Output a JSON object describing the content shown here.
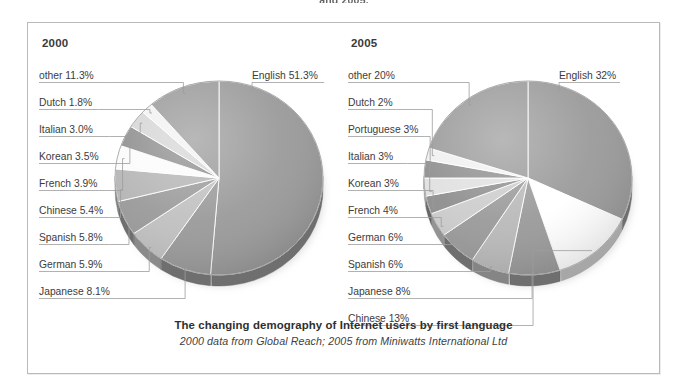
{
  "top_clipped_heading": "and 2005.",
  "frame": {
    "border_color": "#b9b9b9"
  },
  "caption": {
    "title": "The changing demography of Internet users by first language",
    "subtitle": "2000 data from Global Reach; 2005 from Miniwatts International Ltd"
  },
  "panels": [
    {
      "year": "2000"
    },
    {
      "year": "2005"
    }
  ],
  "chart_data": [
    {
      "type": "pie",
      "title": "2000",
      "start_angle_deg": 0,
      "direction": "clockwise",
      "units": "percent",
      "labels": [
        "English 51.3%",
        "Japanese 8.1%",
        "German 5.9%",
        "Spanish 5.8%",
        "Chinese 5.4%",
        "French 3.9%",
        "Korean 3.5%",
        "Italian 3.0%",
        "Dutch 1.8%",
        "other 11.3%"
      ],
      "categories": [
        "English",
        "Japanese",
        "German",
        "Spanish",
        "Chinese",
        "French",
        "Korean",
        "Italian",
        "Dutch",
        "other"
      ],
      "values": [
        51.3,
        8.1,
        5.9,
        5.8,
        5.4,
        3.9,
        3.5,
        3.0,
        1.8,
        11.3
      ],
      "colors": [
        "#9a9a9a",
        "#9a9a9a",
        "#c0c0c0",
        "#9a9a9a",
        "#b5b5b5",
        "#fbfbfb",
        "#8e8e8e",
        "#d6d6d6",
        "#f2f2f2",
        "#9a9a9a"
      ]
    },
    {
      "type": "pie",
      "title": "2005",
      "start_angle_deg": 0,
      "direction": "clockwise",
      "units": "percent",
      "labels": [
        "English 32%",
        "Chinese 13%",
        "Japanese 8%",
        "Spanish 6%",
        "German 6%",
        "French 4%",
        "Korean 3%",
        "Italian 3%",
        "Portuguese 3%",
        "Dutch 2%",
        "other 20%"
      ],
      "categories": [
        "English",
        "Chinese",
        "Japanese",
        "Spanish",
        "German",
        "French",
        "Korean",
        "Italian",
        "Portuguese",
        "Dutch",
        "other"
      ],
      "values": [
        32,
        13,
        8,
        6,
        6,
        4,
        3,
        3,
        3,
        2,
        20
      ],
      "colors": [
        "#9a9a9a",
        "#ffffff",
        "#9a9a9a",
        "#b9b9b9",
        "#9a9a9a",
        "#cccccc",
        "#8e8e8e",
        "#e0e0e0",
        "#8e8e8e",
        "#f0f0f0",
        "#9a9a9a"
      ]
    }
  ],
  "left_labels": [
    {
      "text": "other 11.3%",
      "x": 11,
      "y": 47
    },
    {
      "text": "Dutch 1.8%",
      "x": 11,
      "y": 74
    },
    {
      "text": "Italian 3.0%",
      "x": 11,
      "y": 101
    },
    {
      "text": "Korean 3.5%",
      "x": 11,
      "y": 128
    },
    {
      "text": "French 3.9%",
      "x": 11,
      "y": 155
    },
    {
      "text": "Chinese 5.4%",
      "x": 11,
      "y": 182
    },
    {
      "text": "Spanish 5.8%",
      "x": 11,
      "y": 209
    },
    {
      "text": "German 5.9%",
      "x": 11,
      "y": 236
    },
    {
      "text": "Japanese 8.1%",
      "x": 11,
      "y": 263
    }
  ],
  "left_label_right": {
    "text": "English 51.3%",
    "x": 224,
    "y": 47
  },
  "right_labels": [
    {
      "text": "other 20%",
      "x": 11,
      "y": 47
    },
    {
      "text": "Dutch 2%",
      "x": 11,
      "y": 74
    },
    {
      "text": "Portuguese 3%",
      "x": 11,
      "y": 101
    },
    {
      "text": "Italian 3%",
      "x": 11,
      "y": 128
    },
    {
      "text": "Korean 3%",
      "x": 11,
      "y": 155
    },
    {
      "text": "French 4%",
      "x": 11,
      "y": 182
    },
    {
      "text": "German 6%",
      "x": 11,
      "y": 209
    },
    {
      "text": "Spanish 6%",
      "x": 11,
      "y": 236
    },
    {
      "text": "Japanese 8%",
      "x": 11,
      "y": 263
    },
    {
      "text": "Chinese 13%",
      "x": 11,
      "y": 290
    }
  ],
  "right_label_right": {
    "text": "English 32%",
    "x": 222,
    "y": 47
  }
}
